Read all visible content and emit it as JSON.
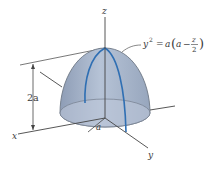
{
  "figure": {
    "type": "3d-solid-of-revolution",
    "axes": {
      "x_label": "x",
      "y_label": "y",
      "z_label": "z"
    },
    "dimensions": {
      "height_label": "2a",
      "radius_label": "a"
    },
    "equation": {
      "lhs": "y",
      "lhs_exp": "2",
      "equals": "=",
      "coef": "a",
      "inner_a": "a",
      "minus": "−",
      "frac_num": "z",
      "frac_den": "2"
    },
    "colors": {
      "dome_fill": "#a9b8cf",
      "dome_edge": "#6d7785",
      "meridian": "#2f6fb3",
      "axis": "#4a4a4a",
      "base_fill": "#b9c5d8"
    }
  }
}
